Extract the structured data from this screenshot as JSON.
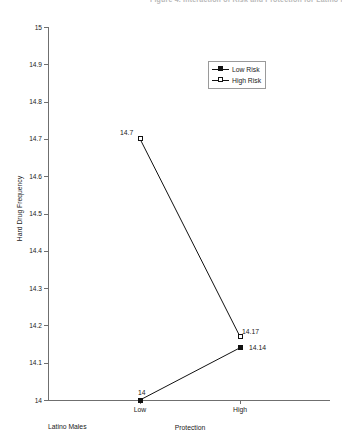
{
  "header": {
    "cut_off_text": "Figure 4. Interaction of Risk and Protection for Latino Males"
  },
  "chart_data": {
    "type": "line",
    "title": "",
    "xlabel": "Protection",
    "ylabel": "Hard Drug Frequency",
    "categories": [
      "Low",
      "High"
    ],
    "ylim": [
      14,
      15
    ],
    "yticks": [
      "15",
      "14.9",
      "14.8",
      "14.7",
      "14.6",
      "14.5",
      "14.4",
      "14.3",
      "14.2",
      "14.1",
      "14"
    ],
    "ytick_values": [
      15,
      14.9,
      14.8,
      14.7,
      14.6,
      14.5,
      14.4,
      14.3,
      14.2,
      14.1,
      14
    ],
    "grid": false,
    "legend_position": "upper right",
    "annotation": "Latino Males",
    "series": [
      {
        "name": "Low Risk",
        "marker": "filled-square",
        "values": [
          14,
          14.14
        ],
        "point_labels": [
          "14",
          "14.14"
        ]
      },
      {
        "name": "High Risk",
        "marker": "open-square",
        "values": [
          14.7,
          14.17
        ],
        "point_labels": [
          "14.7",
          "14.17"
        ]
      }
    ]
  },
  "colors": {
    "line": "#111111",
    "axis": "#6f6f6f",
    "text": "#1a1a1a",
    "background": "#ffffff"
  }
}
